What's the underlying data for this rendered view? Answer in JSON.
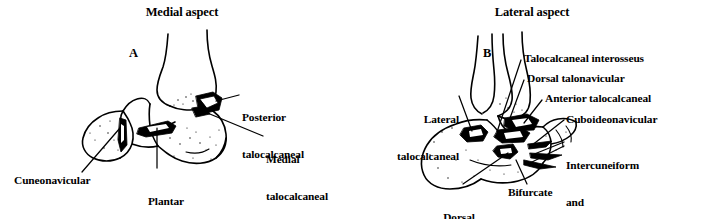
{
  "figure": {
    "background_color": "#ffffff",
    "ink_color": "#000000",
    "width": 705,
    "height": 219
  },
  "panels": [
    {
      "id": "A",
      "letter": "A",
      "title": "Medial aspect",
      "labels": [
        {
          "key": "posterior_talocalcaneal",
          "lines": [
            "Posterior",
            "talocalcaneal"
          ]
        },
        {
          "key": "medial_talocalcaneal",
          "lines": [
            "Medial",
            "talocalcaneal"
          ]
        },
        {
          "key": "cuneonavicular",
          "lines": [
            "Cuneonavicular"
          ]
        },
        {
          "key": "plantar_calcaneonavicular",
          "lines": [
            "Plantar",
            "calcaneonavicular",
            "(spring ligment)"
          ]
        }
      ]
    },
    {
      "id": "B",
      "letter": "B",
      "title": "Lateral aspect",
      "labels": [
        {
          "key": "talocalcaneal_interosseus",
          "lines": [
            "Talocalcaneal interosseus"
          ]
        },
        {
          "key": "dorsal_talonavicular",
          "lines": [
            "Dorsal talonavicular"
          ]
        },
        {
          "key": "anterior_talocalcaneal",
          "lines": [
            "Anterior talocalcaneal"
          ]
        },
        {
          "key": "cuboideonavicular",
          "lines": [
            "Cuboideonavicular"
          ]
        },
        {
          "key": "intercuneiform_and_cuneocuboid",
          "lines": [
            "Intercuneiform",
            "and",
            "cuneocuboid"
          ]
        },
        {
          "key": "lateral_talocalcaneal",
          "lines": [
            "Lateral",
            "talocalcaneal"
          ]
        },
        {
          "key": "dorsal_calcaneocuboid",
          "lines": [
            "Dorsal",
            "calcaneocuboid"
          ]
        },
        {
          "key": "bifurcate",
          "lines": [
            "Bifurcate"
          ]
        }
      ]
    }
  ],
  "text": {
    "title_medial": "Medial aspect",
    "title_lateral": "Lateral aspect",
    "letter_a": "A",
    "letter_b": "B",
    "posterior_talocalcaneal_l1": "Posterior",
    "posterior_talocalcaneal_l2": "talocalcaneal",
    "medial_talocalcaneal_l1": "Medial",
    "medial_talocalcaneal_l2": "talocalcaneal",
    "cuneonavicular": "Cuneonavicular",
    "plantar_l1": "Plantar",
    "plantar_l2": "calcaneonavicular",
    "plantar_l3": "(spring ligment)",
    "talocalcaneal_interosseus": "Talocalcaneal interosseus",
    "dorsal_talonavicular": "Dorsal talonavicular",
    "anterior_talocalcaneal": "Anterior talocalcaneal",
    "cuboideonavicular": "Cuboideonavicular",
    "intercuneiform_l1": "Intercuneiform",
    "intercuneiform_l2": "and",
    "intercuneiform_l3": "cuneocuboid",
    "lateral_talocalcaneal_l1": "Lateral",
    "lateral_talocalcaneal_l2": "talocalcaneal",
    "dorsal_calcaneocuboid_l1": "Dorsal",
    "dorsal_calcaneocuboid_l2": "calcaneocuboid",
    "bifurcate": "Bifurcate"
  }
}
